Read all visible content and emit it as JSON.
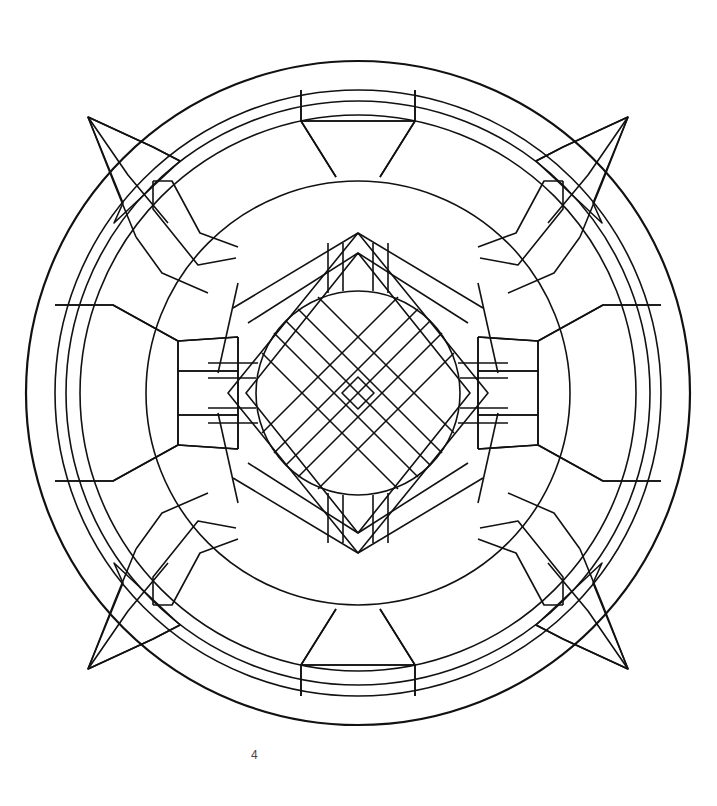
{
  "page": {
    "type": "coloring-book-page",
    "page_number": "4",
    "line_color": "#111111",
    "background_color": "#ffffff"
  }
}
